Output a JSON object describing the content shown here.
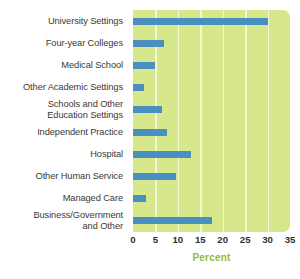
{
  "chart_data": {
    "type": "bar",
    "orientation": "horizontal",
    "title": "",
    "subtitle": "",
    "xlabel": "Percent",
    "ylabel": "",
    "categories": [
      "University Settings",
      "Four-year Colleges",
      "Medical School",
      "Other Academic Settings",
      "Schools and Other\nEducation Settings",
      "Independent Practice",
      "Hospital",
      "Other Human Service",
      "Managed Care",
      "Business/Government\nand Other"
    ],
    "values": [
      30,
      7,
      5,
      2.5,
      6.5,
      7.5,
      13,
      9.5,
      3,
      17.5
    ],
    "xlim": [
      0,
      35
    ],
    "xticks": [
      0,
      5,
      10,
      15,
      20,
      25,
      30,
      35
    ],
    "xtick_labels": [
      "0",
      "5",
      "10",
      "15",
      "20",
      "25",
      "30",
      "35"
    ],
    "grid": true,
    "grid_axis": "x",
    "legend": false,
    "colors": {
      "bar": "#4a8fbf",
      "plot_background": "#d7e78c",
      "gridline": "#f2f7d8",
      "axis_title": "#9ab832",
      "label_text": "#3a3a3a",
      "tick_text": "#2f2f2f",
      "page_background": "#ffffff"
    }
  }
}
